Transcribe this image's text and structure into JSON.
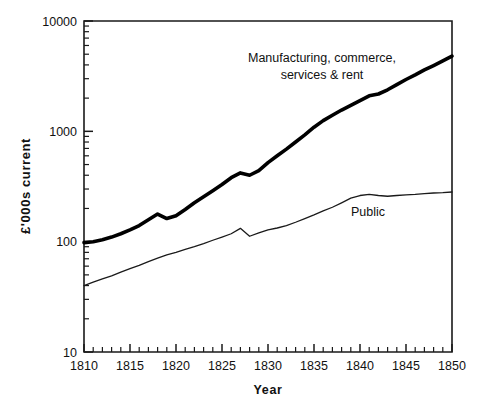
{
  "chart_data": {
    "type": "line",
    "title": "",
    "xlabel": "Year",
    "ylabel": "£'000s  current",
    "xlim": [
      1810,
      1850
    ],
    "ylim": [
      10,
      10000
    ],
    "yscale": "log",
    "grid": false,
    "legend_position": "inline-annotations",
    "x_major_ticks": [
      1810,
      1815,
      1820,
      1825,
      1830,
      1835,
      1840,
      1845,
      1850
    ],
    "x_tick_labels": [
      "1810",
      "1815",
      "1820",
      "1825",
      "1830",
      "1835",
      "1840",
      "1845",
      "1850"
    ],
    "x_minor_tick_step": 1,
    "y_major_ticks": [
      10,
      100,
      1000,
      10000
    ],
    "y_tick_labels": [
      "10",
      "100",
      "1000",
      "10000"
    ],
    "y_minor_ticks": [
      20,
      30,
      40,
      50,
      60,
      70,
      80,
      90,
      200,
      300,
      400,
      500,
      600,
      700,
      800,
      900,
      2000,
      3000,
      4000,
      5000,
      6000,
      7000,
      8000,
      9000
    ],
    "x": [
      1810,
      1811,
      1812,
      1813,
      1814,
      1815,
      1816,
      1817,
      1818,
      1819,
      1820,
      1821,
      1822,
      1823,
      1824,
      1825,
      1826,
      1827,
      1828,
      1829,
      1830,
      1831,
      1832,
      1833,
      1834,
      1835,
      1836,
      1837,
      1838,
      1839,
      1840,
      1841,
      1842,
      1843,
      1844,
      1845,
      1846,
      1847,
      1848,
      1849,
      1850
    ],
    "series": [
      {
        "name": "Manufacturing, commerce, services & rent",
        "label_lines": [
          "Manufacturing,  commerce,",
          "services & rent"
        ],
        "style": "thick",
        "values": [
          98,
          100,
          104,
          110,
          118,
          128,
          140,
          158,
          178,
          162,
          172,
          196,
          225,
          255,
          290,
          330,
          380,
          420,
          400,
          440,
          520,
          600,
          690,
          800,
          930,
          1090,
          1250,
          1400,
          1560,
          1720,
          1900,
          2100,
          2180,
          2380,
          2650,
          2950,
          3250,
          3600,
          3950,
          4350,
          4800
        ]
      },
      {
        "name": "Public",
        "label_lines": [
          "Public"
        ],
        "style": "thin",
        "values": [
          40,
          43,
          46,
          49,
          53,
          57,
          61,
          66,
          71,
          76,
          80,
          85,
          90,
          96,
          103,
          110,
          118,
          132,
          112,
          120,
          128,
          133,
          140,
          150,
          162,
          175,
          190,
          205,
          225,
          248,
          262,
          268,
          262,
          258,
          262,
          266,
          268,
          272,
          276,
          278,
          282
        ]
      }
    ],
    "annotations": [
      {
        "id": "manufacturing-annotation",
        "text_lines": [
          "Manufacturing,  commerce,",
          "services & rent"
        ],
        "x_px": 322,
        "y_px": 62,
        "anchor": "middle",
        "line_height": 17
      },
      {
        "id": "public-annotation",
        "text_lines": [
          "Public"
        ],
        "x_px": 368,
        "y_px": 216,
        "anchor": "middle",
        "line_height": 17
      }
    ],
    "colors": {
      "background": "#ffffff",
      "axis": "#1a1a1a",
      "series_manufacturing": "#000000",
      "series_public": "#1a1a1a",
      "text": "#111111"
    },
    "plot_box_px": {
      "left": 84,
      "right": 452,
      "top": 21,
      "bottom": 352
    }
  }
}
